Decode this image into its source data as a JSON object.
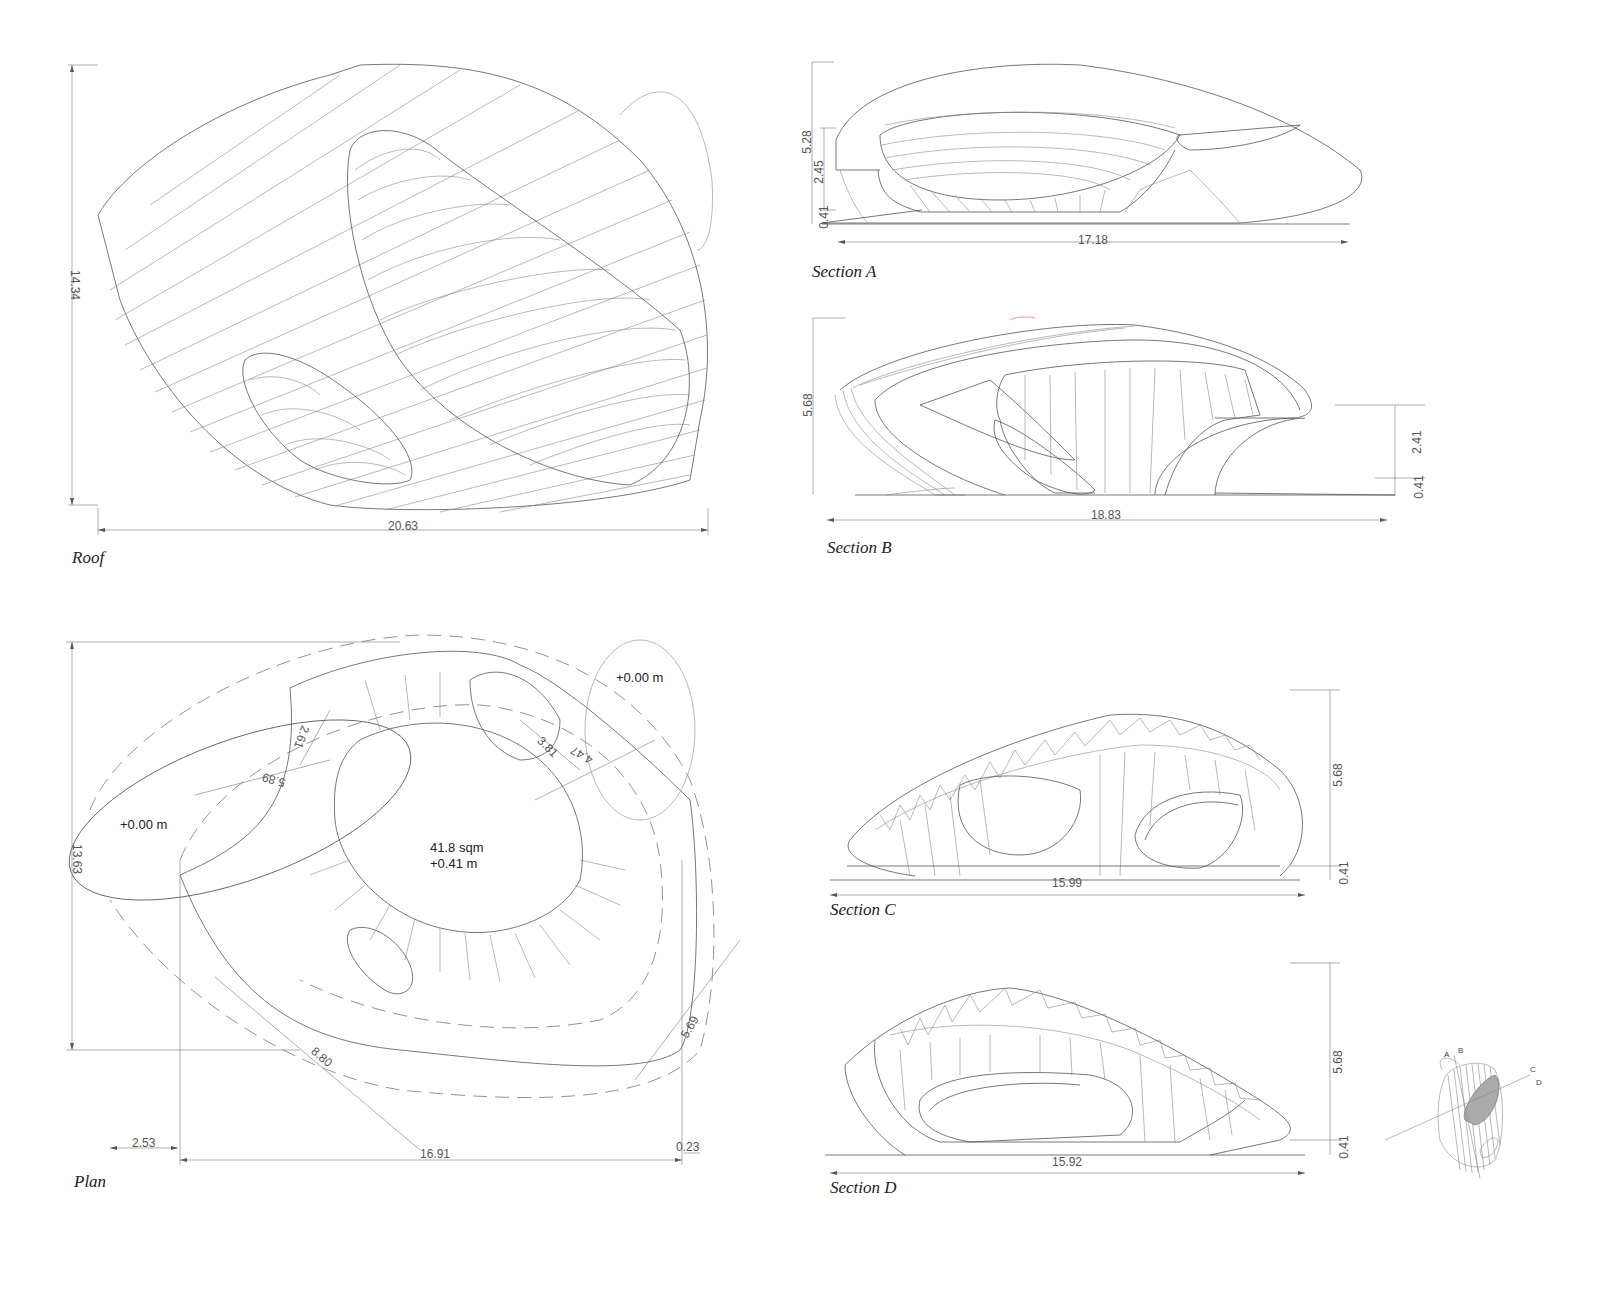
{
  "drawings": {
    "roof": {
      "caption": "Roof",
      "dims": {
        "height": "14.34",
        "width": "20.63"
      }
    },
    "section_a": {
      "caption": "Section A",
      "dims": {
        "total_height": "5.28",
        "opening_height": "2.45",
        "floor_offset": "0.41",
        "width": "17.18"
      }
    },
    "section_b": {
      "caption": "Section B",
      "dims": {
        "total_height": "5.68",
        "opening_height": "2.41",
        "floor_offset": "0.41",
        "width": "18.83"
      }
    },
    "plan": {
      "caption": "Plan",
      "area_label": "41.8 sqm",
      "center_level": "+0.41 m",
      "left_level": "+0.00 m",
      "right_level": "+0.00 m",
      "dims": {
        "height": "13.63",
        "width": "16.91",
        "left_offset": "2.53",
        "right_offset": "0.23",
        "d_2_61": "2.61",
        "d_5_89": "5.89",
        "d_3_81": "3.81",
        "d_4_47": "4.47",
        "d_8_80": "8.80",
        "d_5_69": "5.69"
      }
    },
    "section_c": {
      "caption": "Section C",
      "dims": {
        "total_height": "5.68",
        "floor_offset": "0.41",
        "width": "15.99"
      }
    },
    "section_d": {
      "caption": "Section D",
      "dims": {
        "total_height": "5.68",
        "floor_offset": "0.41",
        "width": "15.92"
      }
    },
    "key_plan": {
      "labels": [
        "A",
        "B",
        "C",
        "D"
      ]
    }
  }
}
